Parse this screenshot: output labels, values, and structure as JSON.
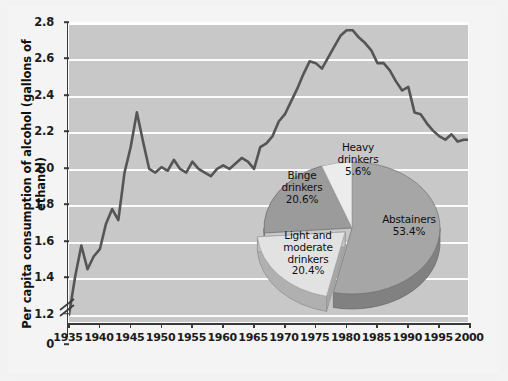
{
  "chart_data": [
    {
      "type": "line",
      "title": "",
      "xlabel": "",
      "ylabel": "Per capita consumption of alcohol (gallons of ethanol)",
      "xlim": [
        1935,
        2000
      ],
      "ylim": [
        1.15,
        2.8
      ],
      "axis_break": true,
      "axis_break_note": "y-axis broken between 0 and 1.2",
      "grid": true,
      "legend": "none",
      "y_ticks": [
        "0",
        "1.2",
        "1.4",
        "1.6",
        "1.8",
        "2.0",
        "2.2",
        "2.4",
        "2.6",
        "2.8"
      ],
      "x_ticks": [
        "1935",
        "1940",
        "1945",
        "1950",
        "1955",
        "1960",
        "1965",
        "1970",
        "1975",
        "1980",
        "1985",
        "1990",
        "1995",
        "2000"
      ],
      "line_color": "#555555",
      "plot_bg": "#c8c8c8",
      "gridline_color": "#fdfdfd",
      "x": [
        1935,
        1936,
        1937,
        1938,
        1939,
        1940,
        1941,
        1942,
        1943,
        1944,
        1945,
        1946,
        1947,
        1948,
        1949,
        1950,
        1951,
        1952,
        1953,
        1954,
        1955,
        1956,
        1957,
        1958,
        1959,
        1960,
        1961,
        1962,
        1963,
        1964,
        1965,
        1966,
        1967,
        1968,
        1969,
        1970,
        1971,
        1972,
        1973,
        1974,
        1975,
        1976,
        1977,
        1978,
        1979,
        1980,
        1981,
        1982,
        1983,
        1984,
        1985,
        1986,
        1987,
        1988,
        1989,
        1990,
        1991,
        1992,
        1993,
        1994,
        1995,
        1996,
        1997,
        1998,
        1999,
        2000
      ],
      "values": [
        1.2,
        1.41,
        1.58,
        1.45,
        1.52,
        1.56,
        1.7,
        1.78,
        1.72,
        1.98,
        2.12,
        2.31,
        2.15,
        2.0,
        1.98,
        2.01,
        1.99,
        2.05,
        2.0,
        1.98,
        2.04,
        2.0,
        1.98,
        1.96,
        2.0,
        2.02,
        2.0,
        2.03,
        2.06,
        2.04,
        2.0,
        2.12,
        2.14,
        2.18,
        2.26,
        2.3,
        2.37,
        2.44,
        2.52,
        2.59,
        2.58,
        2.55,
        2.61,
        2.67,
        2.73,
        2.76,
        2.76,
        2.72,
        2.69,
        2.65,
        2.58,
        2.58,
        2.54,
        2.48,
        2.43,
        2.45,
        2.31,
        2.3,
        2.25,
        2.21,
        2.18,
        2.16,
        2.19,
        2.15,
        2.16,
        2.16
      ]
    },
    {
      "type": "pie",
      "title": "",
      "labels": [
        "Abstainers",
        "Light and moderate drinkers",
        "Binge drinkers",
        "Heavy drinkers"
      ],
      "values": [
        53.4,
        20.4,
        20.6,
        5.6
      ],
      "value_labels": [
        "53.4%",
        "20.4%",
        "20.6%",
        "5.6%"
      ],
      "colors": [
        "#a6a6a6",
        "#e2e2e2",
        "#9b9b9b",
        "#ececec"
      ],
      "exploded": [
        false,
        true,
        false,
        false
      ],
      "style": "3d"
    }
  ],
  "axis": {
    "y_title": "Per capita consumption of alcohol (gallons of ethanol)",
    "y_ticks": [
      {
        "label": "2.8",
        "value": 2.8
      },
      {
        "label": "2.6",
        "value": 2.6
      },
      {
        "label": "2.4",
        "value": 2.4
      },
      {
        "label": "2.2",
        "value": 2.2
      },
      {
        "label": "2.0",
        "value": 2.0
      },
      {
        "label": "1.8",
        "value": 1.8
      },
      {
        "label": "1.6",
        "value": 1.6
      },
      {
        "label": "1.4",
        "value": 1.4
      },
      {
        "label": "1.2",
        "value": 1.2
      },
      {
        "label": "0",
        "value": 0
      }
    ],
    "x_ticks": [
      {
        "label": "1935"
      },
      {
        "label": "1940"
      },
      {
        "label": "1945"
      },
      {
        "label": "1950"
      },
      {
        "label": "1955"
      },
      {
        "label": "1960"
      },
      {
        "label": "1965"
      },
      {
        "label": "1970"
      },
      {
        "label": "1975"
      },
      {
        "label": "1980"
      },
      {
        "label": "1985"
      },
      {
        "label": "1990"
      },
      {
        "label": "1995"
      },
      {
        "label": "2000"
      }
    ]
  },
  "pie": {
    "slices": [
      {
        "name": "abstainers",
        "label": "Abstainers",
        "percent": "53.4%"
      },
      {
        "name": "light-moderate-drinkers",
        "label_line1": "Light and",
        "label_line2": "moderate",
        "label_line3": "drinkers",
        "percent": "20.4%"
      },
      {
        "name": "binge-drinkers",
        "label_line1": "Binge",
        "label_line2": "drinkers",
        "percent": "20.6%"
      },
      {
        "name": "heavy-drinkers",
        "label_line1": "Heavy",
        "label_line2": "drinkers",
        "percent": "5.6%"
      }
    ]
  }
}
